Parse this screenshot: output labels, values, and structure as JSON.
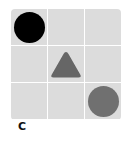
{
  "figure": {
    "label": "C",
    "grid": {
      "rows": 3,
      "cols": 3,
      "cell_color": "#dcdcdc",
      "gap_color": "#ffffff",
      "cells": [
        [
          {
            "shape": "circle",
            "color": "#000000"
          },
          {
            "shape": "none"
          },
          {
            "shape": "none"
          }
        ],
        [
          {
            "shape": "none"
          },
          {
            "shape": "triangle",
            "color": "#666666"
          },
          {
            "shape": "none"
          }
        ],
        [
          {
            "shape": "none"
          },
          {
            "shape": "none"
          },
          {
            "shape": "circle",
            "color": "#707070"
          }
        ]
      ]
    }
  }
}
